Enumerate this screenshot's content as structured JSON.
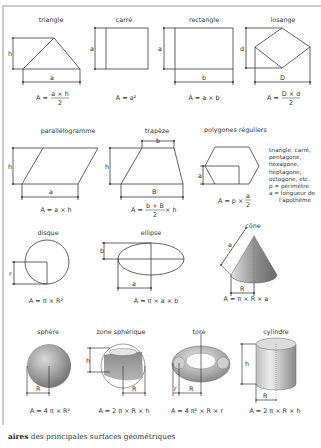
{
  "caption": {
    "bold": "aires",
    "rest": " des principales surfaces géométriques"
  },
  "shapes": {
    "triangle": {
      "name": "triangle",
      "dims": [
        "h",
        "a"
      ],
      "formula_prefix": "A = ",
      "num": "a × h",
      "den": "2"
    },
    "carre": {
      "name": "carré",
      "dims": [
        "a"
      ],
      "formula": "A = a²"
    },
    "rectangle": {
      "name": "rectangle",
      "dims": [
        "a",
        "b"
      ],
      "formula": "A = a × b"
    },
    "losange": {
      "name": "losange",
      "dims": [
        "d",
        "D"
      ],
      "formula_prefix": "A = ",
      "num": "D × d",
      "den": "2"
    },
    "parallelogramme": {
      "name": "parallélogramme",
      "dims": [
        "h",
        "a"
      ],
      "formula": "A = a × h"
    },
    "trapeze": {
      "name": "trapèze",
      "dims": [
        "b",
        "h",
        "B"
      ],
      "formula_prefix": "A = ",
      "num": "b + B",
      "den": "2",
      "suffix": " × h"
    },
    "polygones": {
      "name": "polygones réguliers",
      "dims": [
        "a"
      ],
      "formula_prefix": "A = p × ",
      "num": "a",
      "den": "2",
      "notes": [
        "triangle, carré,",
        "pentagone,",
        "hexagone,",
        "heptagone,",
        "octogone, etc.",
        "p = périmètre",
        "a = longueur de",
        "l'apothème"
      ]
    },
    "disque": {
      "name": "disque",
      "dims": [
        "r"
      ],
      "formula": "A = π × R²"
    },
    "ellipse": {
      "name": "ellipse",
      "dims": [
        "b",
        "a"
      ],
      "formula": "A = π × a × b"
    },
    "cone": {
      "name": "cône",
      "dims": [
        "a",
        "R"
      ],
      "formula": "A = π × R × a"
    },
    "sphere": {
      "name": "sphère",
      "dims": [
        "R"
      ],
      "formula": "A = 4 π × R²"
    },
    "zone_spherique": {
      "name": "zone sphérique",
      "dims": [
        "h",
        "R"
      ],
      "formula": "A = 2 π × R × h"
    },
    "tore": {
      "name": "tore",
      "dims": [
        "r",
        "R"
      ],
      "formula": "A = 4 π² × R × r"
    },
    "cylindre": {
      "name": "cylindre",
      "dims": [
        "h",
        "R"
      ],
      "formula": "A = 2 π × R × h"
    }
  },
  "colors": {
    "line": "#3a3a3a",
    "frame": "#c9c9c9",
    "solid_dark": "#7a7a7a",
    "solid_light": "#d8d8d8"
  }
}
